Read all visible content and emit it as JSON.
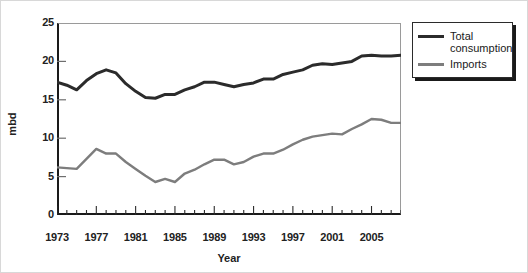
{
  "chart_data": {
    "type": "line",
    "title": "",
    "xlabel": "Year",
    "ylabel": "mbd",
    "xlim": [
      1973,
      2008
    ],
    "ylim": [
      0,
      25
    ],
    "grid": false,
    "legend_position": "top-right (outside plot)",
    "x": [
      1973,
      1974,
      1975,
      1976,
      1977,
      1978,
      1979,
      1980,
      1981,
      1982,
      1983,
      1984,
      1985,
      1986,
      1987,
      1988,
      1989,
      1990,
      1991,
      1992,
      1993,
      1994,
      1995,
      1996,
      1997,
      1998,
      1999,
      2000,
      2001,
      2002,
      2003,
      2004,
      2005,
      2006,
      2007,
      2008
    ],
    "y_ticks": [
      0,
      5,
      10,
      15,
      20,
      25
    ],
    "x_ticks": [
      1973,
      1977,
      1981,
      1985,
      1989,
      1993,
      1997,
      2001,
      2005
    ],
    "x_tick_labels": [
      "1973",
      "1977",
      "1981",
      "1985",
      "1989",
      "1993",
      "1997",
      "2001",
      "2005"
    ],
    "y_tick_labels": [
      "0",
      "5",
      "10",
      "15",
      "20",
      "25"
    ],
    "series": [
      {
        "name": "Total consumption",
        "color": "#2b2b2b",
        "width": 3,
        "values": [
          17.3,
          16.9,
          16.3,
          17.5,
          18.4,
          18.9,
          18.5,
          17.1,
          16.1,
          15.3,
          15.2,
          15.7,
          15.7,
          16.3,
          16.7,
          17.3,
          17.3,
          17.0,
          16.7,
          17.0,
          17.2,
          17.7,
          17.7,
          18.3,
          18.6,
          18.9,
          19.5,
          19.7,
          19.6,
          19.8,
          20.0,
          20.7,
          20.8,
          20.7,
          20.7,
          20.8
        ]
      },
      {
        "name": "Imports",
        "color": "#7d7d7d",
        "width": 2.4,
        "values": [
          6.2,
          6.1,
          6.0,
          7.3,
          8.6,
          8.0,
          8.0,
          6.9,
          6.0,
          5.1,
          4.3,
          4.7,
          4.3,
          5.4,
          5.9,
          6.6,
          7.2,
          7.2,
          6.6,
          6.9,
          7.6,
          8.0,
          8.0,
          8.5,
          9.2,
          9.8,
          10.2,
          10.4,
          10.6,
          10.5,
          11.2,
          11.8,
          12.5,
          12.4,
          12.0,
          12.0
        ]
      }
    ]
  },
  "axis": {
    "y_title": "mbd",
    "x_title": "Year"
  },
  "legend": {
    "items": [
      {
        "label": "Total\nconsumption",
        "color": "#2b2b2b"
      },
      {
        "label": "Imports",
        "color": "#7d7d7d"
      }
    ]
  }
}
